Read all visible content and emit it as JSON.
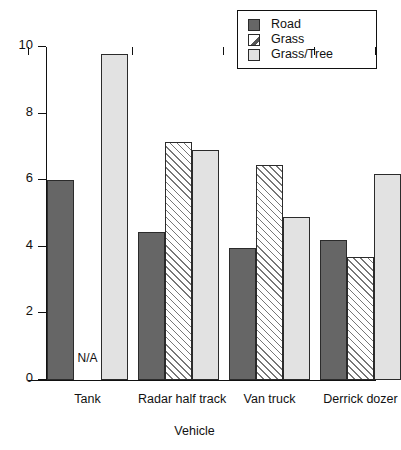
{
  "chart_data": {
    "type": "bar",
    "title": "",
    "xlabel": "Vehicle",
    "ylabel": "",
    "ylim": [
      0,
      10
    ],
    "yticks": [
      0,
      2,
      4,
      6,
      8,
      10
    ],
    "grid": false,
    "legend_position": "top-right",
    "categories": [
      "Tank",
      "Radar half track",
      "Van truck",
      "Derrick dozer"
    ],
    "series": [
      {
        "name": "Road",
        "color": "#666666",
        "pattern": "solid",
        "values": [
          6.0,
          4.45,
          3.95,
          4.2
        ],
        "labels": [
          "6.0",
          "4.45",
          "3.95",
          "4.2"
        ]
      },
      {
        "name": "Grass",
        "color": "#ffffff",
        "pattern": "diagonal-hatch",
        "values": [
          null,
          7.15,
          6.45,
          3.7
        ],
        "labels": [
          "N/A",
          "7.15",
          "6.45",
          "3.7"
        ]
      },
      {
        "name": "Grass/Tree",
        "color": "#e2e2e2",
        "pattern": "solid",
        "values": [
          9.8,
          6.9,
          4.9,
          6.2
        ],
        "labels": [
          "9.8",
          "6.9",
          "4.9",
          "6.2"
        ]
      }
    ],
    "missing_label": "N/A"
  },
  "legend": {
    "items": [
      {
        "label": "Road",
        "swatch": "swatch-road-dark-gray"
      },
      {
        "label": "Grass",
        "swatch": "swatch-grass-hatched"
      },
      {
        "label": "Grass/Tree",
        "swatch": "swatch-grass-tree-light-gray"
      }
    ]
  },
  "axes": {
    "y": {
      "ticks": [
        {
          "value": 10,
          "label": "10"
        },
        {
          "value": 8,
          "label": "8"
        },
        {
          "value": 6,
          "label": "6"
        },
        {
          "value": 4,
          "label": "4"
        },
        {
          "value": 2,
          "label": "2"
        },
        {
          "value": 0,
          "label": "0"
        }
      ]
    },
    "x": {
      "title": "Vehicle",
      "groups": [
        "Tank",
        "Radar half track",
        "Van truck",
        "Derrick dozer"
      ]
    }
  }
}
